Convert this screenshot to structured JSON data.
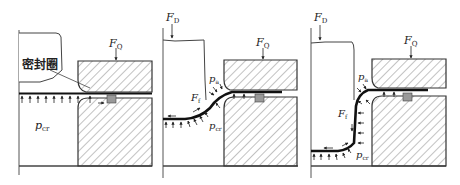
{
  "diagram": {
    "type": "process-stages",
    "panel_count": 3,
    "colors": {
      "line": "#333333",
      "sheet": "#111111",
      "hatch": "#555555",
      "seal": "#999999",
      "background": "#ffffff"
    },
    "panels": [
      {
        "id": "stage-1",
        "labels": {
          "seal_ring": "密封圈",
          "blank_holder_force": {
            "main": "F",
            "sub": "Q"
          },
          "chamber_pressure": {
            "main": "p",
            "sub": "cr"
          }
        }
      },
      {
        "id": "stage-2",
        "labels": {
          "punch_force": {
            "main": "F",
            "sub": "D"
          },
          "blank_holder_force": {
            "main": "F",
            "sub": "Q"
          },
          "friction_force": {
            "main": "F",
            "sub": "f"
          },
          "upper_pressure": {
            "main": "p",
            "sub": "a"
          },
          "chamber_pressure": {
            "main": "p",
            "sub": "cr"
          }
        }
      },
      {
        "id": "stage-3",
        "labels": {
          "punch_force": {
            "main": "F",
            "sub": "D"
          },
          "blank_holder_force": {
            "main": "F",
            "sub": "Q"
          },
          "friction_force": {
            "main": "F",
            "sub": "f"
          },
          "upper_pressure": {
            "main": "p",
            "sub": "a"
          },
          "chamber_pressure": {
            "main": "p",
            "sub": "cr"
          }
        }
      }
    ]
  }
}
